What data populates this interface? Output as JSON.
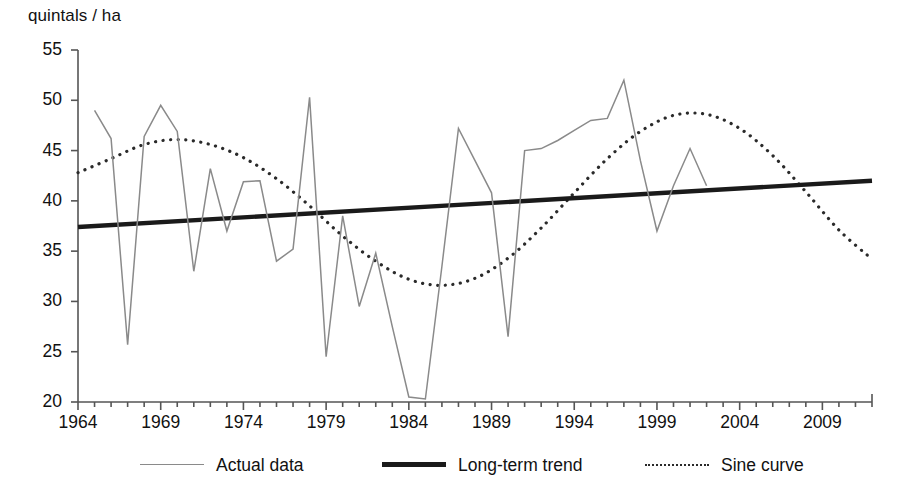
{
  "axes": {
    "ylabel": "quintals / ha",
    "y_ticks": [
      20,
      25,
      30,
      35,
      40,
      45,
      50,
      55
    ],
    "x_ticks_labeled": [
      1964,
      1969,
      1974,
      1979,
      1984,
      1989,
      1994,
      1999,
      2009,
      2004
    ],
    "ylim": [
      20,
      55
    ],
    "xlim": [
      1964,
      2012
    ]
  },
  "legend": {
    "items": [
      {
        "label": "Actual data",
        "style": "thin-solid-gray",
        "color": "#8a8a8a"
      },
      {
        "label": "Long-term trend",
        "style": "thick-solid-black",
        "color": "#1a1a1a"
      },
      {
        "label": "Sine curve",
        "style": "dotted-black",
        "color": "#2a2a2a"
      }
    ]
  },
  "chart_data": {
    "type": "line",
    "title": "",
    "xlabel": "",
    "ylabel": "quintals / ha",
    "xlim": [
      1964,
      2012
    ],
    "ylim": [
      20,
      55
    ],
    "grid": false,
    "legend_position": "bottom",
    "x_tick_labels": [
      "1964",
      "1969",
      "1974",
      "1979",
      "1984",
      "1989",
      "1994",
      "1999",
      "2004",
      "2009"
    ],
    "y_tick_labels": [
      "20",
      "25",
      "30",
      "35",
      "40",
      "45",
      "50",
      "55"
    ],
    "series": [
      {
        "name": "Actual data",
        "color": "#8a8a8a",
        "x": [
          1965,
          1966,
          1967,
          1968,
          1969,
          1970,
          1971,
          1972,
          1973,
          1974,
          1975,
          1976,
          1977,
          1978,
          1979,
          1980,
          1981,
          1982,
          1983,
          1984,
          1985,
          1986,
          1987,
          1988,
          1989,
          1990,
          1991,
          1992,
          1993,
          1994,
          1995,
          1996,
          1997,
          1998,
          1999,
          2000,
          2001,
          2002
        ],
        "values": [
          49.0,
          46.2,
          25.7,
          46.4,
          49.5,
          46.9,
          33.0,
          43.2,
          37.0,
          41.9,
          42.0,
          34.0,
          35.2,
          50.3,
          24.5,
          38.5,
          29.5,
          34.8,
          27.5,
          20.5,
          20.3,
          33.5,
          47.2,
          44.0,
          40.8,
          26.5,
          45.0,
          45.2,
          46.0,
          47.0,
          48.0,
          48.2,
          52.0,
          44.0,
          37.0,
          41.5,
          45.2,
          41.5
        ]
      },
      {
        "name": "Long-term trend",
        "color": "#1a1a1a",
        "x": [
          1964,
          2012
        ],
        "values": [
          37.4,
          42.0
        ]
      },
      {
        "name": "Sine curve",
        "color": "#2a2a2a",
        "x": [
          1964,
          1966,
          1968,
          1970,
          1972,
          1974,
          1976,
          1978,
          1980,
          1982,
          1984,
          1986,
          1988,
          1990,
          1992,
          1994,
          1996,
          1998,
          2000,
          2002,
          2004,
          2006,
          2008,
          2010,
          2012
        ],
        "values": [
          42.8,
          44.2,
          45.6,
          46.1,
          45.6,
          44.3,
          42.2,
          39.5,
          36.5,
          34.0,
          32.2,
          31.6,
          32.3,
          34.3,
          37.3,
          40.8,
          44.2,
          46.9,
          48.5,
          48.6,
          47.2,
          44.5,
          40.9,
          37.1,
          34.2
        ]
      }
    ]
  }
}
